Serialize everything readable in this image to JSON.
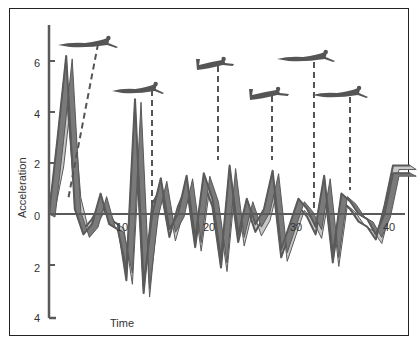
{
  "chart_data": {
    "type": "line",
    "title": "",
    "xlabel": "Time",
    "ylabel": "Acceleration",
    "x_ticks": [
      "10",
      "20",
      "30",
      "40"
    ],
    "y_ticks": [
      "6",
      "4",
      "2",
      "0",
      "2",
      "4"
    ],
    "ylim": [
      -4,
      7
    ],
    "xlim": [
      0,
      43
    ],
    "grid": false,
    "legend": "none",
    "annotations": [
      {
        "type": "swimmer-silhouette",
        "pose": "extended glide",
        "t": 5,
        "label_line_to": "peak at t~2"
      },
      {
        "type": "swimmer-silhouette",
        "pose": "extended glide",
        "t": 12
      },
      {
        "type": "swimmer-silhouette",
        "pose": "kick / knees bent",
        "t": 19.5
      },
      {
        "type": "swimmer-silhouette",
        "pose": "kick / knees bent",
        "t": 26
      },
      {
        "type": "swimmer-silhouette",
        "pose": "extended glide",
        "t": 31
      },
      {
        "type": "swimmer-silhouette",
        "pose": "extended glide",
        "t": 34.5
      }
    ],
    "series": [
      {
        "name": "acceleration (front ribbon, dark)",
        "x": [
          0,
          1,
          2,
          3,
          4,
          5,
          6,
          7,
          8,
          9,
          10,
          11,
          12,
          13,
          14,
          15,
          16,
          17,
          18,
          19,
          20,
          21,
          22,
          23,
          24,
          25,
          26,
          27,
          28,
          29,
          30,
          31,
          32,
          33,
          34,
          35,
          36,
          37,
          38,
          39,
          40,
          41,
          42
        ],
        "values": [
          0,
          3.0,
          6.2,
          0.2,
          -0.8,
          -0.4,
          0.8,
          -0.4,
          -0.6,
          -2.2,
          4.5,
          -2.8,
          0.0,
          1.4,
          -0.6,
          0.0,
          1.5,
          -1.0,
          1.6,
          0.6,
          -1.8,
          1.9,
          -0.8,
          0.6,
          -0.4,
          0.2,
          1.7,
          -1.4,
          -0.4,
          0.6,
          0.2,
          -0.5,
          1.5,
          -1.6,
          0.8,
          0.5,
          0.0,
          -0.2,
          -0.8,
          0.0,
          1.6,
          1.6,
          1.6
        ]
      },
      {
        "name": "acceleration (rear ribbon, light)",
        "x": [
          0,
          1,
          2,
          3,
          4,
          5,
          6,
          7,
          8,
          9,
          10,
          11,
          12,
          13,
          14,
          15,
          16,
          17,
          18,
          19,
          20,
          21,
          22,
          23,
          24,
          25,
          26,
          27,
          28,
          29,
          30,
          31,
          32,
          33,
          34,
          35,
          36,
          37,
          38,
          39,
          40,
          41,
          42
        ],
        "values": [
          0.3,
          2.0,
          5.0,
          0.8,
          -0.6,
          -0.2,
          0.4,
          -0.2,
          -0.4,
          -2.6,
          3.5,
          -3.1,
          0.4,
          1.0,
          -0.9,
          0.3,
          1.1,
          -1.3,
          1.2,
          0.3,
          -2.1,
          1.4,
          -1.1,
          0.3,
          -0.7,
          -0.1,
          1.3,
          -1.7,
          -0.7,
          0.3,
          -0.1,
          -0.8,
          1.1,
          -1.9,
          0.5,
          0.2,
          -0.3,
          -0.5,
          -1.0,
          0.3,
          1.9,
          1.9,
          1.9
        ]
      }
    ]
  },
  "axis": {
    "xlabel": "Time",
    "ylabel": "Acceleration",
    "x_ticks": [
      {
        "label": "10",
        "x": 123
      },
      {
        "label": "20",
        "x": 210
      },
      {
        "label": "30",
        "x": 297
      },
      {
        "label": "40",
        "x": 390
      }
    ],
    "y_ticks": [
      {
        "label": "6",
        "y": 67
      },
      {
        "label": "4",
        "y": 118
      },
      {
        "label": "2",
        "y": 168
      },
      {
        "label": "0",
        "y": 220
      },
      {
        "label": "2",
        "y": 272
      },
      {
        "label": "4",
        "y": 322
      }
    ]
  },
  "colors": {
    "dark_ribbon": "#7a7a7a",
    "light_ribbon": "#c8c8c8",
    "edge": "#5a5a5a",
    "axis": "#5a5a5a",
    "swimmer": "#555555"
  }
}
